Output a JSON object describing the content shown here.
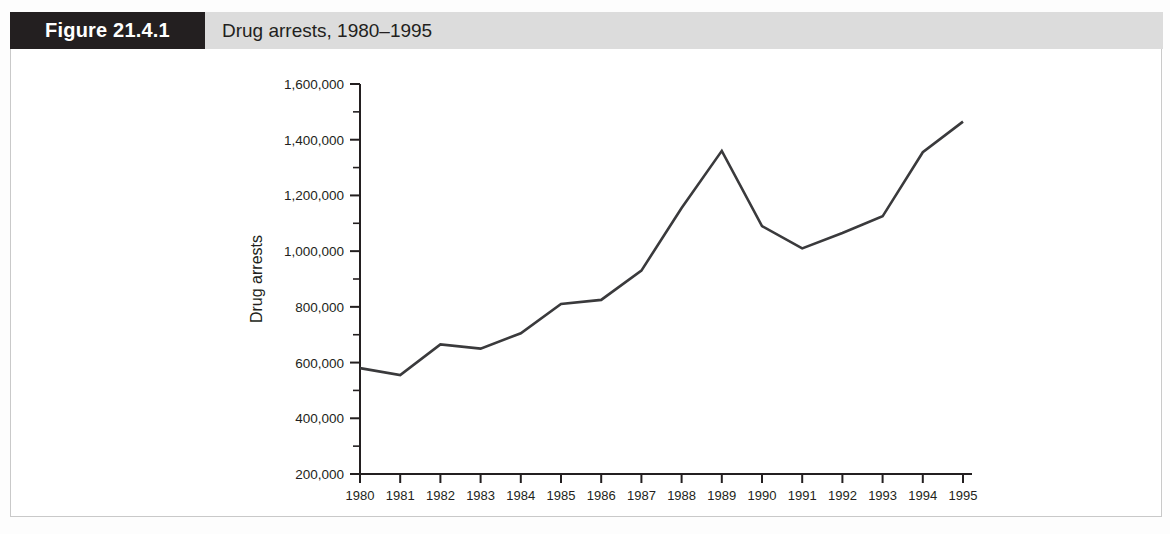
{
  "figure": {
    "number_label": "Figure 21.4.1",
    "caption": "Drug arrests, 1980–1995",
    "header_bg": "#dcdcdc",
    "number_box_bg": "#231f20",
    "line_color": "#3a3a3c",
    "frame_color": "#c9c9c9"
  },
  "chart_data": {
    "type": "line",
    "title": "Drug arrests, 1980–1995",
    "xlabel": "",
    "ylabel": "Drug arrests",
    "x": [
      1980,
      1981,
      1982,
      1983,
      1984,
      1985,
      1986,
      1987,
      1988,
      1989,
      1990,
      1991,
      1992,
      1993,
      1994,
      1995
    ],
    "categories": [
      "1980",
      "1981",
      "1982",
      "1983",
      "1984",
      "1985",
      "1986",
      "1987",
      "1988",
      "1989",
      "1990",
      "1991",
      "1992",
      "1993",
      "1994",
      "1995"
    ],
    "values": [
      580000,
      555000,
      665000,
      650000,
      705000,
      810000,
      825000,
      930000,
      1155000,
      1360000,
      1090000,
      1010000,
      1065000,
      1125000,
      1355000,
      1465000
    ],
    "series": [
      {
        "name": "Drug arrests",
        "values": [
          580000,
          555000,
          665000,
          650000,
          705000,
          810000,
          825000,
          930000,
          1155000,
          1360000,
          1090000,
          1010000,
          1065000,
          1125000,
          1355000,
          1465000
        ]
      }
    ],
    "ylim": [
      200000,
      1600000
    ],
    "ytick_values": [
      200000,
      400000,
      600000,
      800000,
      1000000,
      1200000,
      1400000,
      1600000
    ],
    "ytick_labels": [
      "200,000",
      "400,000",
      "600,000",
      "800,000",
      "1,000,000",
      "1,200,000",
      "1,400,000",
      "1,600,000"
    ],
    "yminor_step": 100000,
    "grid": false,
    "legend": "none"
  }
}
